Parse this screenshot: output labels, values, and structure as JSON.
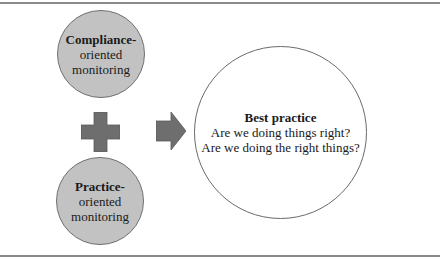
{
  "diagram": {
    "top_circle": {
      "title": "Compliance-",
      "line2": "oriented",
      "line3": "monitoring"
    },
    "bottom_circle": {
      "title": "Practice-",
      "line2": "oriented",
      "line3": "monitoring"
    },
    "operator_icon": "plus-icon",
    "connector_icon": "arrow-right-icon",
    "result_circle": {
      "title": "Best practice",
      "line2": "Are we doing things right?",
      "line3": "Are we doing the right things?"
    },
    "colors": {
      "circle_fill": "#c2c2c2",
      "shape_fill": "#6e6e6e",
      "rule": "#8a8a8a"
    }
  }
}
